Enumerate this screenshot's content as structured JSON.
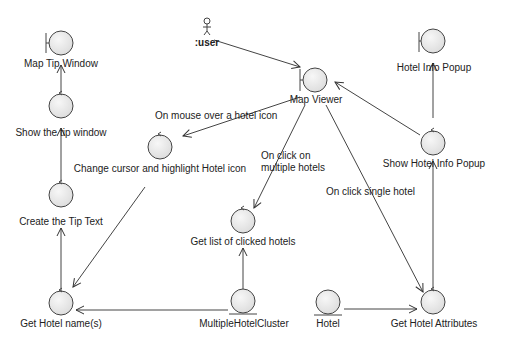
{
  "diagram": {
    "type": "UML robustness / communication diagram",
    "actor": {
      "label": ":user"
    },
    "nodes": {
      "map_tip_window": {
        "label": "Map Tip Window",
        "kind": "boundary"
      },
      "show_tip_window": {
        "label": "Show the tip window",
        "kind": "control"
      },
      "create_tip_text": {
        "label": "Create the Tip Text",
        "kind": "control"
      },
      "get_hotel_names": {
        "label": "Get Hotel name(s)",
        "kind": "control"
      },
      "change_cursor": {
        "label": "Change cursor and highlight Hotel icon",
        "kind": "control"
      },
      "map_viewer": {
        "label": "Map Viewer",
        "kind": "boundary"
      },
      "get_clicked_hotels": {
        "label": "Get list of clicked hotels",
        "kind": "control"
      },
      "multiple_hotel_cluster": {
        "label": "MultipleHotelCluster",
        "kind": "entity"
      },
      "hotel": {
        "label": "Hotel",
        "kind": "entity"
      },
      "get_hotel_attributes": {
        "label": "Get Hotel Attributes",
        "kind": "control"
      },
      "show_hotel_info_popup": {
        "label": "Show Hotel Info Popup",
        "kind": "control"
      },
      "hotel_info_popup": {
        "label": "Hotel Info Popup",
        "kind": "boundary"
      }
    },
    "edge_labels": {
      "mouse_over": "On mouse over a hotel icon",
      "click_multiple_1": "On click on",
      "click_multiple_2": "multiple hotels",
      "click_single": "On click single hotel"
    }
  }
}
